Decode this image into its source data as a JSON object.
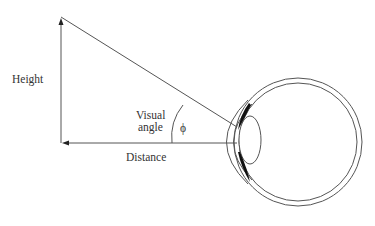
{
  "diagram": {
    "labels": {
      "height": "Height",
      "visual_angle_line1": "Visual",
      "visual_angle_line2": "angle",
      "phi": "ϕ",
      "distance": "Distance"
    },
    "colors": {
      "line": "#555555",
      "text": "#333333",
      "iris": "#111111"
    }
  }
}
